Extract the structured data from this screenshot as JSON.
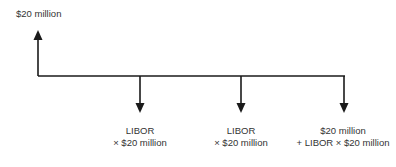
{
  "diagram": {
    "type": "cash-flow timeline",
    "inflow": {
      "label": "$20 million",
      "direction": "up"
    },
    "outflows": [
      {
        "line1": "LIBOR",
        "line2": "× $20 million",
        "direction": "down"
      },
      {
        "line1": "LIBOR",
        "line2": "× $20 million",
        "direction": "down"
      },
      {
        "line1": "$20 million",
        "line2": "+ LIBOR × $20 million",
        "direction": "down"
      }
    ],
    "colors": {
      "line": "#1a1a1a",
      "text": "#333333"
    }
  }
}
